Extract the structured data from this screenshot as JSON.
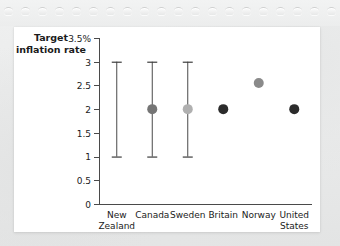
{
  "figure": {
    "card_background": "#ffffff",
    "page_background": "#eceded",
    "perforation_count": 20
  },
  "chart_data": {
    "type": "scatter",
    "title": "",
    "ylabel": "Target inflation rate",
    "xlabel": "",
    "ylim": [
      0,
      3.5
    ],
    "grid": false,
    "legend": "none",
    "ytick_labels": [
      "3.5%",
      "3",
      "2.5",
      "2",
      "1.5",
      "1",
      "0.5",
      "0"
    ],
    "ytick_values": [
      3.5,
      3,
      2.5,
      2,
      1.5,
      1,
      0.5,
      0
    ],
    "categories": [
      "New Zealand",
      "Canada",
      "Sweden",
      "Britain",
      "Norway",
      "United States"
    ],
    "category_lines": [
      [
        "New",
        "Zealand"
      ],
      [
        "Canada",
        ""
      ],
      [
        "Sweden",
        ""
      ],
      [
        "Britain",
        ""
      ],
      [
        "Norway",
        ""
      ],
      [
        "United",
        "States"
      ]
    ],
    "points": [
      {
        "category": "New Zealand",
        "value": null,
        "low": 1.0,
        "high": 3.0,
        "color": "#6f6f6f",
        "has_marker": false,
        "has_range": true
      },
      {
        "category": "Canada",
        "value": 2.0,
        "low": 1.0,
        "high": 3.0,
        "color": "#757575",
        "has_marker": true,
        "has_range": true
      },
      {
        "category": "Sweden",
        "value": 2.0,
        "low": 1.0,
        "high": 3.0,
        "color": "#b0b0b0",
        "has_marker": true,
        "has_range": true
      },
      {
        "category": "Britain",
        "value": 2.0,
        "low": null,
        "high": null,
        "color": "#2b2b2b",
        "has_marker": true,
        "has_range": false
      },
      {
        "category": "Norway",
        "value": 2.55,
        "low": null,
        "high": null,
        "color": "#8a8a8a",
        "has_marker": true,
        "has_range": false
      },
      {
        "category": "United States",
        "value": 2.0,
        "low": null,
        "high": null,
        "color": "#2b2b2b",
        "has_marker": true,
        "has_range": false
      }
    ],
    "marker_radius_px": 5,
    "axis_color": "#4a4a4a"
  }
}
